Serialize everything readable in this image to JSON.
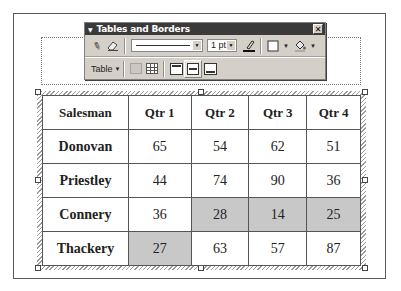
{
  "toolbar": {
    "title": "Tables and Borders",
    "close_icon": "close-icon",
    "row1": {
      "draw_table_icon": "pencil-icon",
      "eraser_icon": "eraser-icon",
      "line_style": "solid-line",
      "line_weight": "1 pt",
      "border_color_icon": "pen-color-icon",
      "border_icon": "outside-border-icon",
      "shading_icon": "paint-bucket-icon"
    },
    "row2": {
      "table_menu_label": "Table",
      "merge_cells_icon": "merge-cells-icon",
      "split_cells_icon": "split-cells-icon",
      "align_top_icon": "align-top-icon",
      "align_center_icon": "align-center-vertical-icon",
      "align_bottom_icon": "align-bottom-icon"
    }
  },
  "table": {
    "headers": [
      "Salesman",
      "Qtr 1",
      "Qtr 2",
      "Qtr 3",
      "Qtr 4"
    ],
    "rows": [
      {
        "name": "Donovan",
        "values": [
          "65",
          "54",
          "62",
          "51"
        ]
      },
      {
        "name": "Priestley",
        "values": [
          "44",
          "74",
          "90",
          "36"
        ]
      },
      {
        "name": "Connery",
        "values": [
          "36",
          "28",
          "14",
          "25"
        ]
      },
      {
        "name": "Thackery",
        "values": [
          "27",
          "63",
          "57",
          "87"
        ]
      }
    ],
    "shaded_color": "#c8c8c8"
  }
}
